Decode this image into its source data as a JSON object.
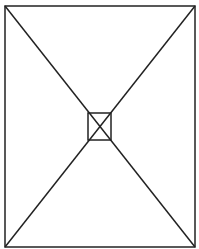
{
  "canvas": {
    "width": 199,
    "height": 249,
    "background": "#ffffff"
  },
  "stroke": {
    "color": "#222222",
    "width": 1.5
  },
  "diagram": {
    "outer_rect": {
      "x1": 5,
      "y1": 6,
      "x2": 195,
      "y2": 247
    },
    "inner_square": {
      "x1": 88,
      "y1": 113,
      "x2": 111,
      "y2": 140
    },
    "diagonals": [
      {
        "from": [
          5,
          6
        ],
        "to": [
          195,
          247
        ]
      },
      {
        "from": [
          195,
          6
        ],
        "to": [
          5,
          247
        ]
      }
    ]
  }
}
